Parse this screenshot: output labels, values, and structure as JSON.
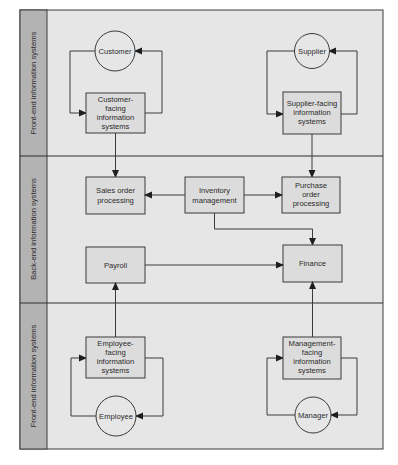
{
  "lanes": [
    {
      "label": "Front-end information systems"
    },
    {
      "label": "Back-end information systems"
    },
    {
      "label": "Front-end information systems"
    }
  ],
  "nodes": {
    "customer": {
      "label": "Customer"
    },
    "customer_facing": {
      "lines": [
        "Customer-",
        "facing",
        "information",
        "systems"
      ]
    },
    "supplier": {
      "label": "Supplier"
    },
    "supplier_facing": {
      "lines": [
        "Supplier-facing",
        "information",
        "systems"
      ]
    },
    "sales_order": {
      "lines": [
        "Sales order",
        "processing"
      ]
    },
    "inventory": {
      "lines": [
        "Inventory",
        "management"
      ]
    },
    "purchase_order": {
      "lines": [
        "Purchase",
        "order",
        "processing"
      ]
    },
    "payroll": {
      "label": "Payroll"
    },
    "finance": {
      "label": "Finance"
    },
    "employee_facing": {
      "lines": [
        "Employee-",
        "facing",
        "information",
        "systems"
      ]
    },
    "employee": {
      "label": "Employee"
    },
    "management_facing": {
      "lines": [
        "Management-",
        "facing",
        "information",
        "systems"
      ]
    },
    "manager": {
      "label": "Manager"
    }
  },
  "colors": {
    "panel_bg": "#e6e6e6",
    "sidebar_bg": "#b3b3b3",
    "box_bg": "#dcdcdc",
    "stroke": "#3a3a3a"
  }
}
